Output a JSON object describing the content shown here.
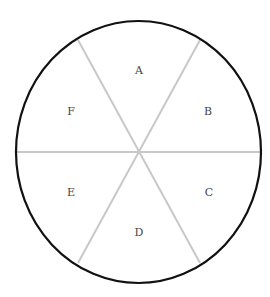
{
  "diagram": {
    "type": "circle-divided-into-sectors",
    "sector_count": 6,
    "sectors": [
      {
        "label": "A",
        "position": "top"
      },
      {
        "label": "B",
        "position": "upper-right"
      },
      {
        "label": "C",
        "position": "lower-right"
      },
      {
        "label": "D",
        "position": "bottom"
      },
      {
        "label": "E",
        "position": "lower-left"
      },
      {
        "label": "F",
        "position": "upper-left"
      }
    ],
    "colors": {
      "outline": "#111111",
      "dividers": "#c8c8c8",
      "label": "#444444",
      "background": "#ffffff"
    }
  }
}
